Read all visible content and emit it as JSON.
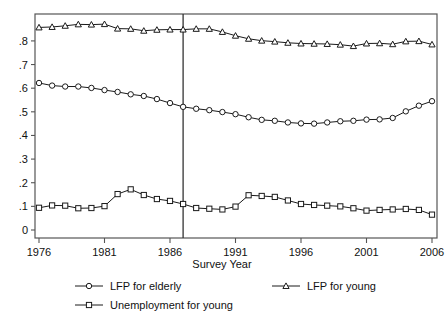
{
  "chart_data": {
    "type": "line",
    "title": "",
    "xlabel": "Survey Year",
    "ylabel": "",
    "xlim": [
      1976,
      2006
    ],
    "ylim": [
      0,
      0.88
    ],
    "grid": false,
    "legend_position": "bottom",
    "x": [
      1976,
      1977,
      1978,
      1979,
      1980,
      1981,
      1982,
      1983,
      1984,
      1985,
      1986,
      1987,
      1988,
      1989,
      1990,
      1991,
      1992,
      1993,
      1994,
      1995,
      1996,
      1997,
      1998,
      1999,
      2000,
      2001,
      2002,
      2003,
      2004,
      2005,
      2006
    ],
    "xticks": [
      "1976",
      "1981",
      "1986",
      "1991",
      "1996",
      "2001",
      "2006"
    ],
    "ytick_labels": [
      "0",
      ".1",
      ".2",
      ".3",
      ".4",
      ".5",
      ".6",
      ".7",
      ".8"
    ],
    "ytick_values": [
      0,
      0.1,
      0.2,
      0.3,
      0.4,
      0.5,
      0.6,
      0.7,
      0.8
    ],
    "annotations": [
      {
        "type": "vertical-line",
        "x": 1987,
        "label": ""
      }
    ],
    "series": [
      {
        "name": "LFP for elderly",
        "marker": "circle",
        "values": [
          0.622,
          0.611,
          0.607,
          0.607,
          0.601,
          0.592,
          0.584,
          0.574,
          0.567,
          0.554,
          0.537,
          0.521,
          0.513,
          0.507,
          0.499,
          0.49,
          0.477,
          0.466,
          0.462,
          0.455,
          0.451,
          0.45,
          0.455,
          0.46,
          0.462,
          0.467,
          0.468,
          0.474,
          0.502,
          0.526,
          0.545
        ]
      },
      {
        "name": "LFP for young",
        "marker": "triangle",
        "values": [
          0.857,
          0.859,
          0.864,
          0.87,
          0.869,
          0.871,
          0.852,
          0.851,
          0.843,
          0.847,
          0.848,
          0.848,
          0.851,
          0.851,
          0.838,
          0.822,
          0.809,
          0.801,
          0.797,
          0.792,
          0.789,
          0.788,
          0.787,
          0.784,
          0.778,
          0.789,
          0.79,
          0.786,
          0.798,
          0.799,
          0.785
        ]
      },
      {
        "name": "Unemployment for young",
        "marker": "square",
        "values": [
          0.094,
          0.104,
          0.103,
          0.092,
          0.093,
          0.101,
          0.152,
          0.172,
          0.148,
          0.131,
          0.123,
          0.11,
          0.093,
          0.09,
          0.087,
          0.099,
          0.147,
          0.144,
          0.14,
          0.125,
          0.11,
          0.106,
          0.103,
          0.1,
          0.092,
          0.082,
          0.085,
          0.087,
          0.089,
          0.085,
          0.065
        ]
      }
    ]
  },
  "legend": {
    "items": [
      {
        "label": "LFP for elderly",
        "marker": "circle"
      },
      {
        "label": "LFP for young",
        "marker": "triangle"
      },
      {
        "label": "Unemployment for young",
        "marker": "square"
      }
    ]
  }
}
